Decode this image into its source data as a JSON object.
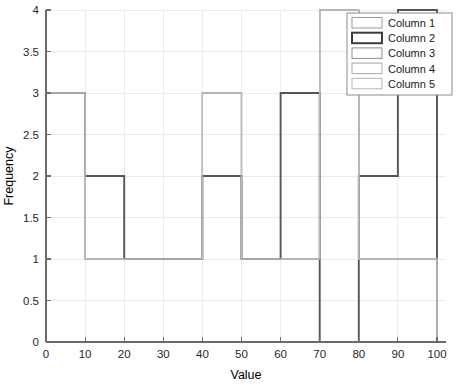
{
  "chart_data": {
    "type": "bar",
    "title": "",
    "xlabel": "Value",
    "ylabel": "Frequency",
    "xlim": [
      0,
      100
    ],
    "ylim": [
      0,
      4
    ],
    "xticks": [
      0,
      10,
      20,
      30,
      40,
      50,
      60,
      70,
      80,
      90,
      100
    ],
    "xtick_labels": [
      "0",
      "10",
      "20",
      "30",
      "40",
      "50",
      "60",
      "70",
      "80",
      "90",
      "100"
    ],
    "yticks": [
      0,
      0.5,
      1,
      1.5,
      2,
      2.5,
      3,
      3.5,
      4
    ],
    "ytick_labels": [
      "0",
      "0.5",
      "1",
      "1.5",
      "2",
      "2.5",
      "3",
      "3.5",
      "4"
    ],
    "grid": true,
    "bin_edges": [
      0,
      10,
      20,
      30,
      40,
      50,
      60,
      70,
      80,
      90,
      100
    ],
    "categories": [
      "0-10",
      "10-20",
      "20-30",
      "30-40",
      "40-50",
      "50-60",
      "60-70",
      "70-80",
      "80-90",
      "90-100"
    ],
    "legend_position": "top-right",
    "series": [
      {
        "name": "Column 1",
        "color": "#999999",
        "line_width": 1.2,
        "values": [
          3,
          1,
          1,
          1,
          3,
          1,
          1,
          4,
          1,
          1
        ]
      },
      {
        "name": "Column 2",
        "color": "#555555",
        "line_width": 1.9,
        "values": [
          3,
          2,
          1,
          1,
          2,
          1,
          3,
          0,
          2,
          4
        ]
      },
      {
        "name": "Column 3",
        "color": "#999999",
        "line_width": 1.2,
        "values": [
          3,
          1,
          1,
          1,
          3,
          1,
          1,
          4,
          1,
          1
        ]
      },
      {
        "name": "Column 4",
        "color": "#aaaaaa",
        "line_width": 1.2,
        "values": [
          3,
          1,
          1,
          1,
          3,
          1,
          1,
          4,
          1,
          1
        ]
      },
      {
        "name": "Column 5",
        "color": "#bbbbbb",
        "line_width": 1.2,
        "values": [
          3,
          1,
          1,
          1,
          3,
          1,
          1,
          4,
          1,
          1
        ]
      }
    ]
  },
  "legend": {
    "entries": [
      {
        "label": "Column 1",
        "swatch_color": "#9a9a9a",
        "swatch_width": 1
      },
      {
        "label": "Column 2",
        "swatch_color": "#3d3d3d",
        "swatch_width": 2
      },
      {
        "label": "Column 3",
        "swatch_color": "#8f8f8f",
        "swatch_width": 1
      },
      {
        "label": "Column 4",
        "swatch_color": "#a8a8a8",
        "swatch_width": 1
      },
      {
        "label": "Column 5",
        "swatch_color": "#b5b5b5",
        "swatch_width": 1
      }
    ]
  },
  "axes": {
    "x_title": "Value",
    "y_title": "Frequency"
  }
}
